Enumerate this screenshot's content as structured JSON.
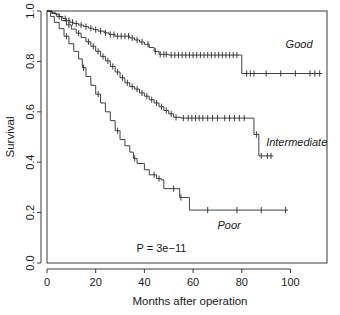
{
  "chart_data": {
    "type": "line",
    "subtype": "kaplan-meier-survival",
    "title": "",
    "xlabel": "Months after operation",
    "ylabel": "Survival",
    "xlim": [
      0,
      115
    ],
    "ylim": [
      0.0,
      1.0
    ],
    "xticks": [
      0,
      20,
      40,
      60,
      80,
      100
    ],
    "xtick_labels": [
      "0",
      "20",
      "40",
      "60",
      "80",
      "100"
    ],
    "yticks": [
      0.0,
      0.2,
      0.4,
      0.6,
      0.8,
      1.0
    ],
    "ytick_labels": [
      "0.0",
      "0.2",
      "0.4",
      "0.6",
      "0.8",
      "1.0"
    ],
    "grid": false,
    "legend_position": "inline-right-of-curves",
    "annotations": [
      {
        "name": "p-value",
        "text": "P = 3e−11",
        "x": 47,
        "y": 0.045
      }
    ],
    "series": [
      {
        "name": "Good",
        "label": "Good",
        "label_x": 98,
        "label_y": 0.855,
        "color": "#2b2b2b",
        "steps": [
          [
            0,
            1.0
          ],
          [
            2,
            0.993
          ],
          [
            3.5,
            0.987
          ],
          [
            5,
            0.978
          ],
          [
            6.5,
            0.97
          ],
          [
            8,
            0.962
          ],
          [
            9.5,
            0.955
          ],
          [
            11,
            0.95
          ],
          [
            13,
            0.944
          ],
          [
            15,
            0.938
          ],
          [
            17,
            0.932
          ],
          [
            19,
            0.926
          ],
          [
            21,
            0.92
          ],
          [
            23.5,
            0.913
          ],
          [
            25.5,
            0.907
          ],
          [
            28,
            0.9
          ],
          [
            31,
            0.9
          ],
          [
            34,
            0.893
          ],
          [
            36,
            0.885
          ],
          [
            38,
            0.877
          ],
          [
            40,
            0.868
          ],
          [
            42,
            0.855
          ],
          [
            44,
            0.84
          ],
          [
            46,
            0.828
          ],
          [
            50,
            0.825
          ],
          [
            79.5,
            0.825
          ],
          [
            80,
            0.752
          ],
          [
            113,
            0.752
          ]
        ],
        "censored": [
          7.5,
          9,
          10.5,
          12,
          14,
          16,
          18,
          20,
          22,
          24,
          26,
          27.5,
          29,
          30.5,
          32,
          33.5,
          35,
          37,
          39,
          41.5,
          44.5,
          46.5,
          48,
          49,
          51,
          52.5,
          54,
          55.5,
          57,
          58.5,
          60,
          61.5,
          63,
          64.5,
          66,
          67.5,
          69,
          70.5,
          72,
          73.5,
          75,
          76.5,
          78,
          82,
          83.5,
          85,
          90,
          96,
          102,
          108,
          110,
          112
        ]
      },
      {
        "name": "Intermediate",
        "label": "Intermediate",
        "label_x": 90,
        "label_y": 0.465,
        "color": "#2b2b2b",
        "steps": [
          [
            0,
            1.0
          ],
          [
            2,
            0.99
          ],
          [
            4,
            0.978
          ],
          [
            6,
            0.962
          ],
          [
            8,
            0.945
          ],
          [
            10,
            0.928
          ],
          [
            12,
            0.912
          ],
          [
            14,
            0.895
          ],
          [
            16,
            0.878
          ],
          [
            18,
            0.86
          ],
          [
            20,
            0.84
          ],
          [
            22,
            0.82
          ],
          [
            24,
            0.802
          ],
          [
            26,
            0.78
          ],
          [
            28,
            0.758
          ],
          [
            30,
            0.735
          ],
          [
            32,
            0.715
          ],
          [
            34,
            0.7
          ],
          [
            36,
            0.69
          ],
          [
            38,
            0.675
          ],
          [
            40,
            0.662
          ],
          [
            42,
            0.648
          ],
          [
            44,
            0.635
          ],
          [
            46,
            0.62
          ],
          [
            48,
            0.605
          ],
          [
            50,
            0.592
          ],
          [
            52,
            0.578
          ],
          [
            55,
            0.575
          ],
          [
            84,
            0.575
          ],
          [
            85,
            0.51
          ],
          [
            87,
            0.425
          ],
          [
            93,
            0.425
          ]
        ],
        "censored": [
          5,
          9,
          13,
          17,
          19,
          21,
          23,
          25,
          27,
          29,
          31,
          33,
          35,
          37,
          39,
          41,
          43,
          45,
          47,
          49,
          51,
          53,
          56,
          58,
          59.5,
          61,
          62.5,
          64,
          66,
          68,
          70,
          73,
          75,
          77,
          79,
          81,
          86,
          88,
          90.5,
          92
        ]
      },
      {
        "name": "Poor",
        "label": "Poor",
        "label_x": 70,
        "label_y": 0.135,
        "color": "#2b2b2b",
        "steps": [
          [
            0,
            1.0
          ],
          [
            1.5,
            0.978
          ],
          [
            3,
            0.955
          ],
          [
            5,
            0.93
          ],
          [
            7,
            0.9
          ],
          [
            9,
            0.87
          ],
          [
            11,
            0.84
          ],
          [
            13,
            0.81
          ],
          [
            14.5,
            0.775
          ],
          [
            16,
            0.74
          ],
          [
            18,
            0.705
          ],
          [
            20,
            0.67
          ],
          [
            22,
            0.635
          ],
          [
            24,
            0.6
          ],
          [
            26,
            0.565
          ],
          [
            28,
            0.525
          ],
          [
            30,
            0.49
          ],
          [
            32,
            0.465
          ],
          [
            34,
            0.44
          ],
          [
            35.5,
            0.415
          ],
          [
            37,
            0.395
          ],
          [
            40,
            0.37
          ],
          [
            42,
            0.35
          ],
          [
            45,
            0.335
          ],
          [
            47,
            0.33
          ],
          [
            48,
            0.295
          ],
          [
            53,
            0.295
          ],
          [
            54.5,
            0.26
          ],
          [
            58,
            0.26
          ],
          [
            58.5,
            0.21
          ],
          [
            99,
            0.21
          ]
        ],
        "censored": [
          8,
          15,
          21,
          29,
          36,
          44,
          46,
          52,
          55,
          66,
          78,
          88,
          98
        ]
      }
    ]
  },
  "plot": {
    "background": "#ffffff",
    "frame_color": "#3a3a3a",
    "curve_color": "#2b2b2b",
    "text_color": "#1a1a1a"
  }
}
